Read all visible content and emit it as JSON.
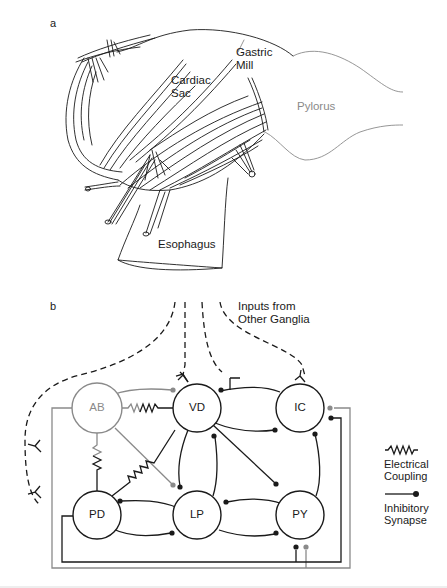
{
  "figure": {
    "panel_a": {
      "label": "a",
      "structures": {
        "gastric_mill": [
          "Gastric",
          "Mill"
        ],
        "cardiac_sac": [
          "Cardiac",
          "Sac"
        ],
        "pylorus": "Pylorus",
        "esophagus": "Esophagus"
      }
    },
    "panel_b": {
      "label": "b",
      "inputs_label": [
        "Inputs from",
        "Other Ganglia"
      ],
      "neurons": [
        {
          "id": "AB",
          "label": "AB",
          "color": "#8a8a8a"
        },
        {
          "id": "VD",
          "label": "VD",
          "color": "#1a1a1a"
        },
        {
          "id": "IC",
          "label": "IC",
          "color": "#1a1a1a"
        },
        {
          "id": "PD",
          "label": "PD",
          "color": "#1a1a1a"
        },
        {
          "id": "LP",
          "label": "LP",
          "color": "#1a1a1a"
        },
        {
          "id": "PY",
          "label": "PY",
          "color": "#1a1a1a"
        }
      ],
      "electrical_coupling": [
        [
          "AB",
          "VD"
        ],
        [
          "AB",
          "PD"
        ],
        [
          "PD",
          "VD"
        ]
      ],
      "inhibitory_synapses": [
        {
          "from": "AB",
          "to": "VD"
        },
        {
          "from": "AB",
          "to": "LP"
        },
        {
          "from": "AB",
          "to": "IC"
        },
        {
          "from": "AB",
          "to": "PY"
        },
        {
          "from": "IC",
          "to": "VD"
        },
        {
          "from": "VD",
          "to": "IC"
        },
        {
          "from": "VD",
          "to": "LP"
        },
        {
          "from": "LP",
          "to": "VD"
        },
        {
          "from": "VD",
          "to": "PY"
        },
        {
          "from": "PY",
          "to": "IC"
        },
        {
          "from": "LP",
          "to": "PD"
        },
        {
          "from": "PD",
          "to": "LP"
        },
        {
          "from": "PY",
          "to": "LP"
        },
        {
          "from": "LP",
          "to": "PY"
        },
        {
          "from": "PD",
          "to": "IC"
        },
        {
          "from": "PD",
          "to": "PY"
        }
      ],
      "legend": {
        "electrical": [
          "Electrical",
          "Coupling"
        ],
        "inhibitory": [
          "Inhibitory",
          "Synapse"
        ]
      }
    },
    "colors": {
      "ink": "#1a1a1a",
      "ab_gray": "#8a8a8a",
      "pylorus_gray": "#8a8a8a"
    }
  }
}
